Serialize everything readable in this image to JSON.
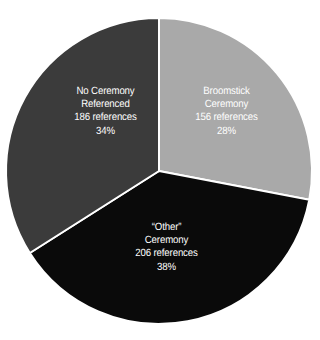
{
  "chart_data": {
    "type": "pie",
    "title": "",
    "subtitle": "",
    "xlabel": "",
    "ylabel": "",
    "grid": false,
    "legend_position": "none",
    "labels_inside_slices": true,
    "total_references": 548,
    "start_angle_deg": 0,
    "direction": "clockwise",
    "categories": [
      "Broomstick Ceremony",
      "“Other” Ceremony",
      "No Ceremony Referenced"
    ],
    "values": [
      156,
      206,
      186
    ],
    "percentages": [
      28,
      38,
      34
    ],
    "colors": [
      "#a9a9a9",
      "#0a0a0a",
      "#3b3b3b"
    ],
    "slices": [
      {
        "key": "broomstick",
        "name_lines": [
          "Broomstick",
          "Ceremony"
        ],
        "references_text": "156 references",
        "value": 156,
        "percent_text": "28%",
        "percent": 28,
        "color": "#a9a9a9",
        "label_color": "#ffffff",
        "start_angle_deg": 0,
        "end_angle_deg": 100.8
      },
      {
        "key": "other",
        "name_lines": [
          "“Other”",
          "Ceremony"
        ],
        "references_text": "206 references",
        "value": 206,
        "percent_text": "38%",
        "percent": 38,
        "color": "#0a0a0a",
        "label_color": "#ffffff",
        "start_angle_deg": 100.8,
        "end_angle_deg": 237.6
      },
      {
        "key": "no_ceremony",
        "name_lines": [
          "No Ceremony",
          "Referenced"
        ],
        "references_text": "186 references",
        "value": 186,
        "percent_text": "34%",
        "percent": 34,
        "color": "#3b3b3b",
        "label_color": "#ffffff",
        "start_angle_deg": 237.6,
        "end_angle_deg": 360
      }
    ],
    "background_color": "#ffffff",
    "divider_color": "#ffffff",
    "geometry": {
      "center_x": 159,
      "center_y": 171,
      "radius": 153
    }
  }
}
